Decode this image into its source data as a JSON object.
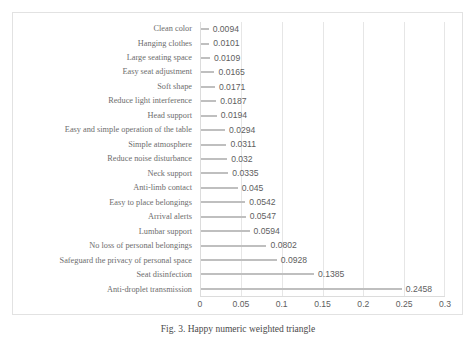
{
  "caption": "Fig. 3. Happy numeric weighted triangle",
  "chart_data": {
    "type": "bar",
    "orientation": "horizontal",
    "title": "",
    "xlabel": "",
    "ylabel": "",
    "xlim": [
      0,
      0.3
    ],
    "xticks": [
      "0",
      "0.05",
      "0.1",
      "0.15",
      "0.2",
      "0.25",
      "0.3"
    ],
    "xtick_values": [
      0,
      0.05,
      0.1,
      0.15,
      0.2,
      0.25,
      0.3
    ],
    "grid": true,
    "legend": "none",
    "bar_color": "#bfbfbf",
    "categories": [
      "Clean color",
      "Hanging clothes",
      "Large seating space",
      "Easy seat adjustment",
      "Soft shape",
      "Reduce light interference",
      "Head support",
      "Easy and simple operation of the table",
      "Simple atmosphere",
      "Reduce noise disturbance",
      "Neck support",
      "Anti-limb contact",
      "Easy to place belongings",
      "Arrival alerts",
      "Lumbar support",
      "No loss of personal belongings",
      "Safeguard the privacy of personal space",
      "Seat disinfection",
      "Anti-droplet transmission"
    ],
    "values": [
      0.0094,
      0.0101,
      0.0109,
      0.0165,
      0.0171,
      0.0187,
      0.0194,
      0.0294,
      0.0311,
      0.032,
      0.0335,
      0.045,
      0.0542,
      0.0547,
      0.0594,
      0.0802,
      0.0928,
      0.1385,
      0.2458
    ],
    "value_labels": [
      "0.0094",
      "0.0101",
      "0.0109",
      "0.0165",
      "0.0171",
      "0.0187",
      "0.0194",
      "0.0294",
      "0.0311",
      "0.032",
      "0.0335",
      "0.045",
      "0.0542",
      "0.0547",
      "0.0594",
      "0.0802",
      "0.0928",
      "0.1385",
      "0.2458"
    ]
  }
}
